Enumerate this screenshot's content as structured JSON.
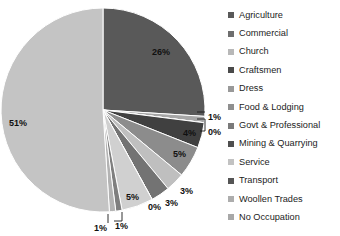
{
  "chart_data": {
    "type": "pie",
    "title": "",
    "subtitle": "",
    "xlabel": "",
    "ylabel": "",
    "legend_position": "right",
    "grid": false,
    "start_angle_deg": 0,
    "direction": "clockwise",
    "categories": [
      "Agriculture",
      "Commercial",
      "Church",
      "Craftsmen",
      "Dress",
      "Food & Lodging",
      "Govt & Professional",
      "Mining & Quarrying",
      "Service",
      "Transport",
      "Woollen Trades",
      "No Occupation"
    ],
    "values": [
      26,
      1,
      0,
      4,
      5,
      3,
      3,
      0,
      5,
      1,
      1,
      51
    ],
    "data_labels": [
      "26%",
      "1%",
      "0%",
      "4%",
      "5%",
      "3%",
      "3%",
      "0%",
      "5%",
      "1%",
      "1%",
      "51%"
    ],
    "colors": [
      "#595959",
      "#a6a6a6",
      "#d9d9d9",
      "#404040",
      "#8c8c8c",
      "#bfbfbf",
      "#737373",
      "#4d4d4d",
      "#d0d0d0",
      "#7f7f7f",
      "#b3b3b3",
      "#c4c4c4"
    ]
  },
  "pie": {
    "center_x": 103,
    "center_y": 110,
    "radius": 102,
    "labels": [
      {
        "text": "26%",
        "x": 152,
        "y": 48
      },
      {
        "text": "1%",
        "x": 208,
        "y": 113
      },
      {
        "text": "0%",
        "x": 208,
        "y": 128
      },
      {
        "text": "4%",
        "x": 183,
        "y": 129
      },
      {
        "text": "5%",
        "x": 173,
        "y": 150
      },
      {
        "text": "3%",
        "x": 180,
        "y": 187
      },
      {
        "text": "3%",
        "x": 165,
        "y": 199
      },
      {
        "text": "0%",
        "x": 148,
        "y": 203
      },
      {
        "text": "5%",
        "x": 126,
        "y": 193
      },
      {
        "text": "1%",
        "x": 115,
        "y": 222
      },
      {
        "text": "1%",
        "x": 94,
        "y": 224
      },
      {
        "text": "51%",
        "x": 9,
        "y": 119
      }
    ],
    "leaders": [
      {
        "name": "leader-commercial",
        "d": "M 197 112 L 205 112"
      },
      {
        "name": "leader-church",
        "d": "M 197 119 L 205 119 L 205 131 L 200 131"
      },
      {
        "name": "leader-transport",
        "d": "M 122 212 L 122 221 L 114 221"
      },
      {
        "name": "leader-woollen",
        "d": "M 108 214 L 108 223"
      }
    ]
  },
  "legend": {
    "items": [
      {
        "label": "Agriculture",
        "color": "#595959"
      },
      {
        "label": "Commercial",
        "color": "#6e6e6e"
      },
      {
        "label": "Church",
        "color": "#b8b8b8"
      },
      {
        "label": "Craftsmen",
        "color": "#4a4a4a"
      },
      {
        "label": "Dress",
        "color": "#999999"
      },
      {
        "label": "Food & Lodging",
        "color": "#8f8f8f"
      },
      {
        "label": "Govt & Professional",
        "color": "#7a7a7a"
      },
      {
        "label": "Mining & Quarrying",
        "color": "#4f4f4f"
      },
      {
        "label": "Service",
        "color": "#c2c2c2"
      },
      {
        "label": "Transport",
        "color": "#555555"
      },
      {
        "label": "Woollen Trades",
        "color": "#adadad"
      },
      {
        "label": "No Occupation",
        "color": "#a8a8a8"
      }
    ]
  }
}
